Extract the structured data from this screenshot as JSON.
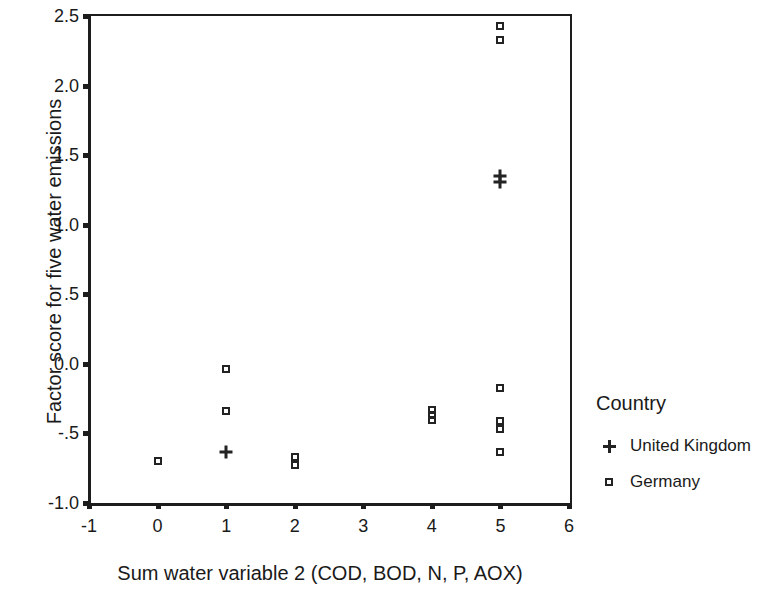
{
  "chart_data": {
    "type": "scatter",
    "title": "",
    "xlabel": "Sum water variable 2 (COD, BOD, N, P, AOX)",
    "ylabel": "Factor score for five water emissions",
    "xlim": [
      -1,
      6
    ],
    "ylim": [
      -1.0,
      2.5
    ],
    "xticks": [
      -1,
      0,
      1,
      2,
      3,
      4,
      5,
      6
    ],
    "xticklabels": [
      "-1",
      "0",
      "1",
      "2",
      "3",
      "4",
      "5",
      "6"
    ],
    "yticks": [
      -1.0,
      -0.5,
      0.0,
      0.5,
      1.0,
      1.5,
      2.0,
      2.5
    ],
    "yticklabels": [
      "-1.0",
      "-.5",
      "0.0",
      ".5",
      "1.0",
      "1.5",
      "2.0",
      "2.5"
    ],
    "grid": false,
    "legend_position": "right",
    "legend_title": "Country",
    "series": [
      {
        "name": "United Kingdom",
        "marker": "plus",
        "points": [
          {
            "x": 1,
            "y": -0.63
          },
          {
            "x": 5,
            "y": 1.31
          },
          {
            "x": 5,
            "y": 1.35
          }
        ]
      },
      {
        "name": "Germany",
        "marker": "square",
        "points": [
          {
            "x": 0,
            "y": -0.7
          },
          {
            "x": 1,
            "y": -0.04
          },
          {
            "x": 1,
            "y": -0.34
          },
          {
            "x": 2,
            "y": -0.67
          },
          {
            "x": 2,
            "y": -0.73
          },
          {
            "x": 4,
            "y": -0.33
          },
          {
            "x": 4,
            "y": -0.37
          },
          {
            "x": 4,
            "y": -0.4
          },
          {
            "x": 5,
            "y": 2.43
          },
          {
            "x": 5,
            "y": 2.33
          },
          {
            "x": 5,
            "y": -0.17
          },
          {
            "x": 5,
            "y": -0.41
          },
          {
            "x": 5,
            "y": -0.47
          },
          {
            "x": 5,
            "y": -0.63
          }
        ]
      }
    ]
  },
  "legend": {
    "title": "Country",
    "entries": [
      {
        "label": "United Kingdom",
        "marker": "plus"
      },
      {
        "label": "Germany",
        "marker": "square"
      }
    ]
  },
  "colors": {
    "marker": "#232323",
    "axis": "#1d1d1d",
    "text": "#1a1a1a",
    "background": "#ffffff"
  }
}
